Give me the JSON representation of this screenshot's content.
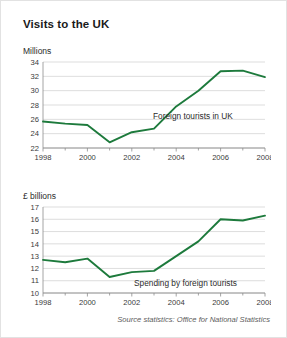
{
  "header": {
    "title": "Visits to the UK"
  },
  "source": {
    "text": "Source statistics: Office for National Statistics"
  },
  "colors": {
    "line": "#1d7a3c",
    "grid": "#d4d4d4",
    "axis": "#8d8d8d",
    "text": "#2b2b2b",
    "background": "#ffffff"
  },
  "chart_data": [
    {
      "type": "line",
      "id": "visits-chart",
      "title": "",
      "unit_label": "Millions",
      "ylabel": "Millions",
      "xlabel": "",
      "annotation": "Foreign tourists in UK",
      "x": [
        1998,
        1999,
        2000,
        2001,
        2002,
        2003,
        2004,
        2005,
        2006,
        2007,
        2008
      ],
      "values": [
        25.7,
        25.4,
        25.2,
        22.8,
        24.2,
        24.7,
        27.8,
        30.0,
        32.7,
        32.8,
        31.9
      ],
      "xtick_labels": [
        "1998",
        "2000",
        "2002",
        "2004",
        "2006",
        "2008"
      ],
      "xticks": [
        1998,
        2000,
        2002,
        2004,
        2006,
        2008
      ],
      "ytick_labels": [
        "22",
        "24",
        "26",
        "28",
        "30",
        "32",
        "34"
      ],
      "yticks": [
        22,
        24,
        26,
        28,
        30,
        32,
        34
      ],
      "xlim": [
        1998,
        2008
      ],
      "ylim": [
        22,
        34
      ],
      "grid": true,
      "legend": "none"
    },
    {
      "type": "line",
      "id": "spending-chart",
      "title": "",
      "unit_label": "£ billions",
      "ylabel": "£ billions",
      "xlabel": "",
      "annotation": "Spending by foreign tourists",
      "x": [
        1998,
        1999,
        2000,
        2001,
        2002,
        2003,
        2004,
        2005,
        2006,
        2007,
        2008
      ],
      "values": [
        12.7,
        12.5,
        12.8,
        11.3,
        11.7,
        11.8,
        13.0,
        14.2,
        16.0,
        15.9,
        16.3
      ],
      "xtick_labels": [
        "1998",
        "2000",
        "2002",
        "2004",
        "2006",
        "2008"
      ],
      "xticks": [
        1998,
        2000,
        2002,
        2004,
        2006,
        2008
      ],
      "ytick_labels": [
        "10",
        "11",
        "12",
        "13",
        "14",
        "15",
        "16",
        "17"
      ],
      "yticks": [
        10,
        11,
        12,
        13,
        14,
        15,
        16,
        17
      ],
      "xlim": [
        1998,
        2008
      ],
      "ylim": [
        10,
        17
      ],
      "grid": true,
      "legend": "none"
    }
  ]
}
